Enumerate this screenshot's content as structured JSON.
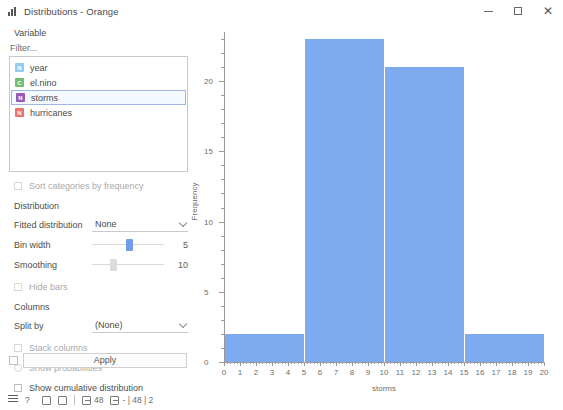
{
  "window": {
    "title": "Distributions - Orange",
    "icon": "bar-chart-icon",
    "minimize_label": "",
    "maximize_label": "",
    "close_label": "✕"
  },
  "panel": {
    "variable_section_label": "Variable",
    "filter_placeholder": "Filter...",
    "variables": [
      {
        "name": "year",
        "icon": "numeric-variable-icon",
        "icon_letter": "N",
        "color": "#8ecdf0",
        "selected": false
      },
      {
        "name": "el.nino",
        "icon": "categorical-variable-icon",
        "icon_letter": "C",
        "color": "#6fbf73",
        "selected": false
      },
      {
        "name": "storms",
        "icon": "numeric-variable-icon",
        "icon_letter": "N",
        "color": "#9b59b6",
        "selected": true
      },
      {
        "name": "hurricanes",
        "icon": "numeric-variable-icon",
        "icon_letter": "N",
        "color": "#e8736f",
        "selected": false
      }
    ],
    "sort_by_frequency_label": "Sort categories by frequency",
    "distribution_section_label": "Distribution",
    "fitted_distribution_label": "Fitted distribution",
    "fitted_distribution_value": "None",
    "bin_width_label": "Bin width",
    "bin_width_value": "5",
    "smoothing_label": "Smoothing",
    "smoothing_value": "10",
    "hide_bars_label": "Hide bars",
    "columns_section_label": "Columns",
    "split_by_label": "Split by",
    "split_by_value": "(None)",
    "stack_columns_label": "Stack columns",
    "show_probabilities_label": "Show probabilities",
    "show_cumulative_label": "Show cumulative distribution",
    "apply_label": "Apply"
  },
  "statusbar": {
    "menu_icon": "hamburger-menu-icon",
    "help_icon": "question-mark-icon",
    "copy_icon": "copy-icon",
    "save_icon": "save-icon",
    "input_icon": "input-arrow-icon",
    "input_count": "48",
    "output_icon": "output-arrow-icon",
    "output_count": "- | 48 | 2"
  },
  "chart_data": {
    "type": "bar",
    "title": "",
    "xlabel": "storms",
    "ylabel": "Frequency",
    "bin_edges": [
      0,
      5,
      10,
      15,
      20
    ],
    "categories": [
      "0-5",
      "5-10",
      "10-15",
      "15-20"
    ],
    "values": [
      2,
      23,
      21,
      2
    ],
    "xlim": [
      0,
      20
    ],
    "ylim": [
      0,
      23.5
    ],
    "xticks": [
      0,
      1,
      2,
      3,
      4,
      5,
      6,
      7,
      8,
      9,
      10,
      11,
      12,
      13,
      14,
      15,
      16,
      17,
      18,
      19,
      20
    ],
    "yticks": [
      0,
      5,
      10,
      15,
      20
    ],
    "y_minor_step": 1,
    "bar_color": "#7eaaf0",
    "grid": false,
    "legend": false
  }
}
